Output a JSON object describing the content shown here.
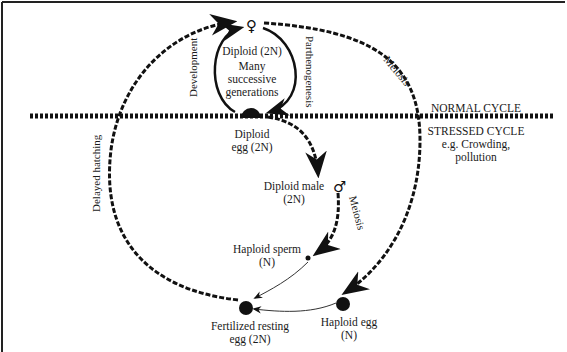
{
  "diagram": {
    "colors": {
      "ink": "#111111",
      "background": "#ffffff"
    },
    "regions": {
      "normal": "NORMAL CYCLE",
      "stressed": "STRESSED CYCLE",
      "stressed_note_1": "e.g. Crowding,",
      "stressed_note_2": "pollution"
    },
    "nodes": {
      "female": {
        "symbol": "♀",
        "label": "Diploid (2N)"
      },
      "many_generations": {
        "line1": "Many",
        "line2": "successive",
        "line3": "generations"
      },
      "diploid_egg": {
        "line1": "Diploid",
        "line2": "egg (2N)"
      },
      "male": {
        "symbol": "♂",
        "line1": "Diploid male",
        "line2": "(2N)"
      },
      "sperm": {
        "line1": "Haploid sperm",
        "line2": "(N)"
      },
      "haploid_egg": {
        "line1": "Haploid egg",
        "line2": "(N)"
      },
      "resting_egg": {
        "line1": "Fertilized resting",
        "line2": "egg (2N)"
      }
    },
    "edges": {
      "development": "Development",
      "parthenogenesis": "Parthenogenesis",
      "meiosis_female": "Meiosis",
      "meiosis_male": "Meiosis",
      "delayed_hatching": "Delayed hatching"
    }
  }
}
